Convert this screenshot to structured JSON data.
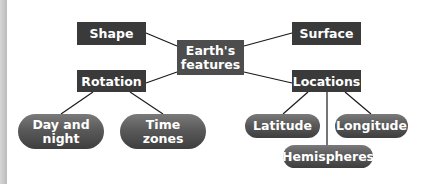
{
  "diagram": {
    "center": {
      "label_line1": "Earth's",
      "label_line2": "features"
    },
    "categories": [
      {
        "id": "shape",
        "label": "Shape"
      },
      {
        "id": "surface",
        "label": "Surface"
      },
      {
        "id": "rotation",
        "label": "Rotation"
      },
      {
        "id": "locations",
        "label": "Locations"
      }
    ],
    "rotation_children": [
      {
        "label_line1": "Day and",
        "label_line2": "night"
      },
      {
        "label_line1": "Time",
        "label_line2": "zones"
      }
    ],
    "locations_children": [
      {
        "label": "Latitude"
      },
      {
        "label": "Longitude"
      },
      {
        "label": "Hemispheres"
      }
    ],
    "colors": {
      "box_fill": "#3a3a3a",
      "center_fill": "#4d4d4d",
      "pill_fill_top": "#7a7a7a",
      "pill_fill_bottom": "#3e3e3e",
      "text": "#ffffff",
      "line": "#1a1a1a"
    }
  }
}
